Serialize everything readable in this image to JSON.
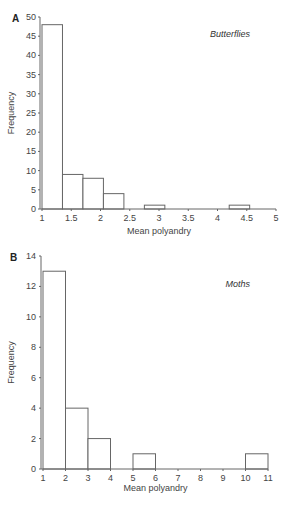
{
  "chart_data": [
    {
      "type": "bar",
      "panel": "A",
      "title": "Butterflies",
      "xlabel": "Mean polyandry",
      "ylabel": "Frequency",
      "xlim": [
        1,
        5
      ],
      "ylim": [
        0,
        50
      ],
      "xticks": [
        "1",
        "1.5",
        "2",
        "2.5",
        "3",
        "3.5",
        "4",
        "4.5",
        "5"
      ],
      "yticks": [
        "0",
        "5",
        "10",
        "15",
        "20",
        "25",
        "30",
        "35",
        "40",
        "45",
        "50"
      ],
      "bins": [
        {
          "x0": 1.0,
          "x1": 1.35,
          "value": 48
        },
        {
          "x0": 1.35,
          "x1": 1.7,
          "value": 9
        },
        {
          "x0": 1.7,
          "x1": 2.05,
          "value": 8
        },
        {
          "x0": 2.05,
          "x1": 2.4,
          "value": 4
        },
        {
          "x0": 2.4,
          "x1": 2.75,
          "value": 0
        },
        {
          "x0": 2.75,
          "x1": 3.1,
          "value": 1
        },
        {
          "x0": 4.2,
          "x1": 4.55,
          "value": 1
        }
      ],
      "grid": false
    },
    {
      "type": "bar",
      "panel": "B",
      "title": "Moths",
      "xlabel": "Mean polyandry",
      "ylabel": "Frequency",
      "xlim": [
        1,
        11
      ],
      "ylim": [
        0,
        14
      ],
      "xticks": [
        "1",
        "2",
        "3",
        "4",
        "5",
        "6",
        "7",
        "8",
        "9",
        "10",
        "11"
      ],
      "yticks": [
        "0",
        "2",
        "4",
        "6",
        "8",
        "10",
        "12",
        "14"
      ],
      "bins": [
        {
          "x0": 1,
          "x1": 2,
          "value": 13
        },
        {
          "x0": 2,
          "x1": 3,
          "value": 4
        },
        {
          "x0": 3,
          "x1": 4,
          "value": 2
        },
        {
          "x0": 5,
          "x1": 6,
          "value": 1
        },
        {
          "x0": 10,
          "x1": 11,
          "value": 1
        }
      ],
      "grid": false
    }
  ]
}
